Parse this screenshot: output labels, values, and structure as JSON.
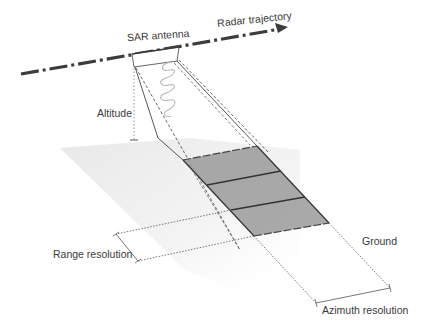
{
  "labels": {
    "radar_trajectory": "Radar trajectory",
    "sar_antenna": "SAR antenna",
    "altitude": "Altitude",
    "ground": "Ground",
    "range_resolution": "Range resolution",
    "azimuth_resolution": "Azimuth resolution"
  },
  "colors": {
    "line": "#3c3c3c",
    "footprint_fill": "#9a9a9a",
    "ground_plane": "#ececec",
    "wave": "#b8b8b8",
    "text": "#3a3a3a"
  },
  "footprint": {
    "cells": 3
  }
}
